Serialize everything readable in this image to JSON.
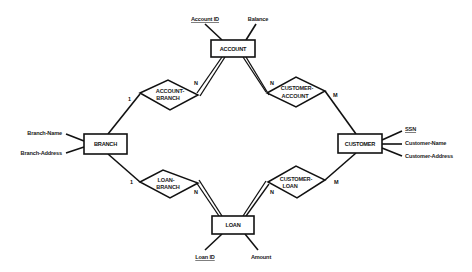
{
  "diagram": {
    "type": "ER diagram",
    "entities": [
      {
        "id": "account",
        "label": "ACCOUNT",
        "attributes": [
          {
            "label": "Account ID",
            "key": true
          },
          {
            "label": "Balance",
            "key": false
          }
        ]
      },
      {
        "id": "branch",
        "label": "BRANCH",
        "attributes": [
          {
            "label": "Branch-Name",
            "key": false
          },
          {
            "label": "Branch-Address",
            "key": false
          }
        ]
      },
      {
        "id": "customer",
        "label": "CUSTOMER",
        "attributes": [
          {
            "label": "SSN",
            "key": true
          },
          {
            "label": "Customer-Name",
            "key": false
          },
          {
            "label": "Customer-Address",
            "key": false
          }
        ]
      },
      {
        "id": "loan",
        "label": "LOAN",
        "attributes": [
          {
            "label": "Loan ID",
            "key": true
          },
          {
            "label": "Amount",
            "key": false
          }
        ]
      }
    ],
    "relationships": [
      {
        "id": "account_branch",
        "line1": "ACCOUNT-",
        "line2": "BRANCH",
        "card_branch": "1",
        "card_account": "N"
      },
      {
        "id": "customer_account",
        "line1": "CUSTOMER-",
        "line2": "ACCOUNT",
        "card_account": "N",
        "card_customer": "M"
      },
      {
        "id": "loan_branch",
        "line1": "LOAN-",
        "line2": "BRANCH",
        "card_branch": "1",
        "card_loan": "N"
      },
      {
        "id": "customer_loan",
        "line1": "CUSTOMER-",
        "line2": "LOAN",
        "card_loan": "N",
        "card_customer": "M"
      }
    ]
  }
}
